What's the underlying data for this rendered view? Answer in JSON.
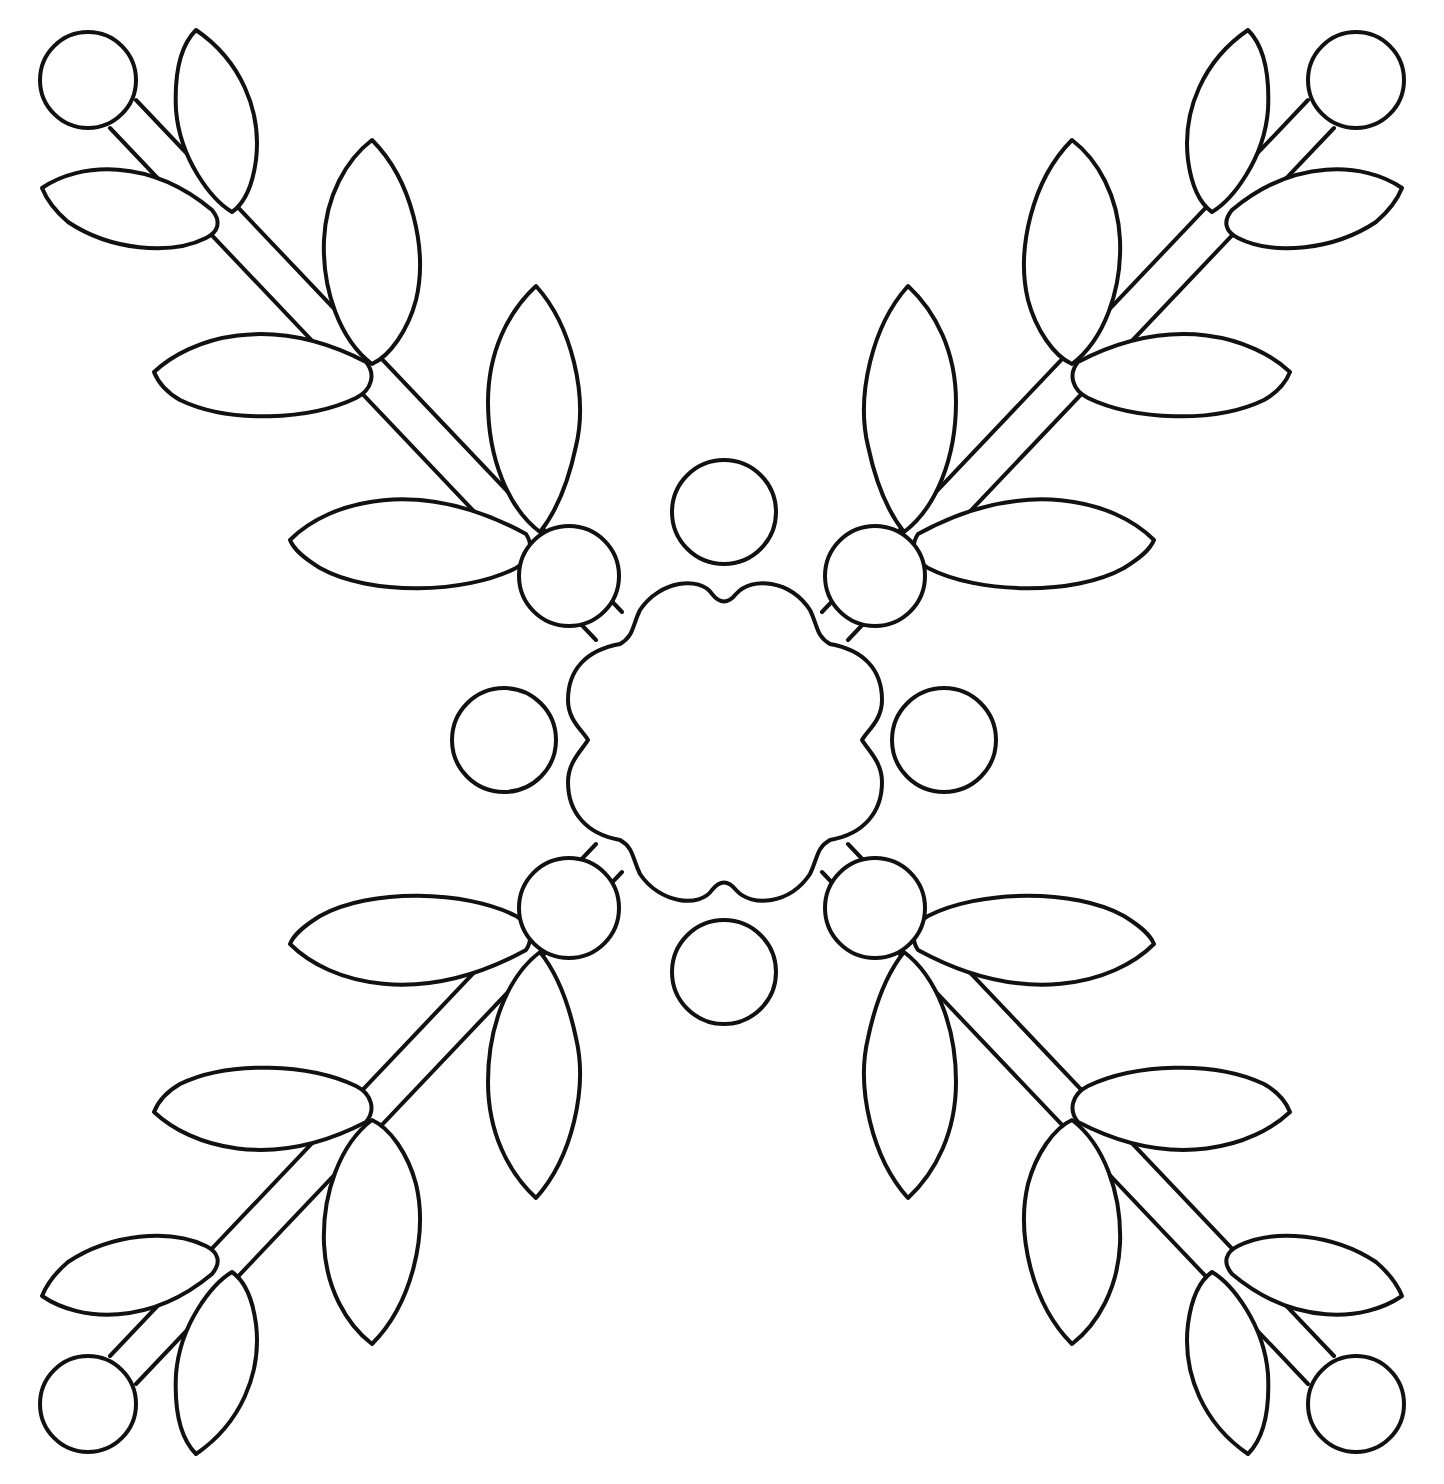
{
  "artwork": {
    "title": "",
    "description": "Line-art applique/quilt pattern: four leafy branches radiating diagonally from a central scalloped square, with small circles (berries) between the branches",
    "stroke_color": "#111111",
    "background_color": "#ffffff",
    "motifs": {
      "branches": 4,
      "leaves_per_branch": 7,
      "berry_circles_at_branch_tips": 4,
      "berry_circles_at_center_corners": 4,
      "loose_circles_around_center": 4,
      "center_shape": "scalloped square"
    }
  }
}
